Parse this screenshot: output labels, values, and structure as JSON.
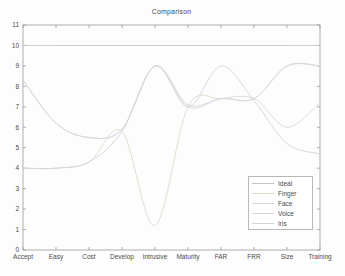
{
  "window": {
    "background": "#fdfdfd"
  },
  "palette": {
    "axis": "#9a9a9a",
    "text": "#4a4a4a",
    "legend_border": "#b8b8b8",
    "legend_bg": "#ffffff"
  },
  "chart_data": {
    "type": "line",
    "title": "Comparison",
    "categories": [
      "Accept",
      "Easy",
      "Cost",
      "Develop",
      "Intrusive",
      "Maturity",
      "FAR",
      "FRR",
      "Size",
      "Training"
    ],
    "xlabel": "",
    "ylabel": "",
    "ylim": [
      0,
      11
    ],
    "yticks": [
      0,
      1,
      2,
      3,
      4,
      5,
      6,
      7,
      8,
      9,
      10,
      11
    ],
    "grid": false,
    "legend_position": "bottom-right",
    "legend_entries": [
      "Ideal",
      "Finger",
      "Face",
      "Voice",
      "Iris"
    ],
    "plot_area": {
      "left": 23,
      "right": 320,
      "top": 25,
      "bottom": 250
    },
    "series": [
      {
        "name": "Ideal",
        "color": "#c2c8c2",
        "values": [
          10,
          10,
          10,
          10,
          10,
          10,
          10,
          10,
          10,
          10
        ]
      },
      {
        "name": "Finger",
        "color": "#ddd8c8",
        "values": [
          4,
          4,
          4.3,
          5.8,
          1.2,
          7,
          7.4,
          7.4,
          9,
          9
        ]
      },
      {
        "name": "Face",
        "color": "#d6d6de",
        "values": [
          8.3,
          6.2,
          5.5,
          5.9,
          9,
          7,
          7.4,
          7.4,
          9,
          9
        ]
      },
      {
        "name": "Voice",
        "color": "#dcd2d8",
        "values": [
          8.3,
          6.2,
          5.5,
          5.9,
          9,
          7.1,
          7.4,
          7.4,
          6,
          7.2
        ]
      },
      {
        "name": "Iris",
        "color": "#cdd6d9",
        "values": [
          4,
          4,
          4.3,
          5.8,
          9,
          7,
          9,
          7.3,
          5.2,
          4.7
        ]
      }
    ]
  }
}
